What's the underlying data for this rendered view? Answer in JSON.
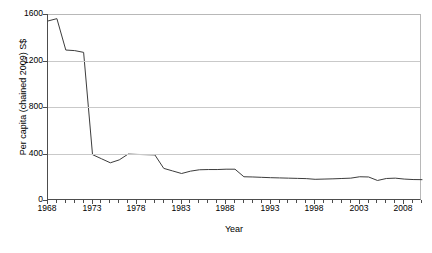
{
  "chart_data": {
    "type": "line",
    "title": "",
    "xlabel": "Year",
    "ylabel": "Per capita (chained 2009) S$",
    "xlim": [
      1968,
      2010
    ],
    "ylim": [
      0,
      1600
    ],
    "ytick_values": [
      0,
      400,
      800,
      1200,
      1600
    ],
    "ytick_labels": [
      "0",
      "400",
      "800",
      "1200",
      "1600"
    ],
    "xtick_values": [
      1968,
      1973,
      1978,
      1983,
      1988,
      1993,
      1998,
      2003,
      2008
    ],
    "xtick_labels": [
      "1968",
      "1973",
      "1978",
      "1983",
      "1988",
      "1993",
      "1998",
      "2003",
      "2008"
    ],
    "minor_xticks": "every year",
    "grid": "horizontal gridlines only",
    "legend": "none",
    "line_color": "#3c3c3c",
    "series": [
      {
        "name": "Per capita (chained 2009) S$",
        "x": [
          1968,
          1969,
          1970,
          1971,
          1972,
          1973,
          1974,
          1975,
          1976,
          1977,
          1978,
          1979,
          1980,
          1981,
          1982,
          1983,
          1984,
          1985,
          1986,
          1987,
          1988,
          1989,
          1990,
          1991,
          1992,
          1993,
          1994,
          1995,
          1996,
          1997,
          1998,
          1999,
          2000,
          2001,
          2002,
          2003,
          2004,
          2005,
          2006,
          2007,
          2008,
          2009,
          2010
        ],
        "values": [
          1540,
          1560,
          1290,
          1285,
          1270,
          390,
          355,
          320,
          345,
          395,
          392,
          390,
          388,
          272,
          250,
          228,
          248,
          260,
          262,
          262,
          265,
          265,
          200,
          198,
          195,
          192,
          190,
          188,
          186,
          184,
          178,
          180,
          182,
          185,
          188,
          200,
          198,
          168,
          185,
          188,
          180,
          176,
          175
        ]
      }
    ]
  },
  "axes": {
    "y_title": "Per capita (chained 2009) S$",
    "x_title": "Year"
  }
}
